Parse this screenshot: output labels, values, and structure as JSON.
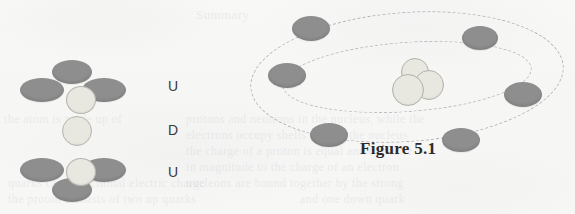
{
  "figure": {
    "caption": "Figure 5.1",
    "background_color": "#f7f7f6",
    "particle_dark_color": "#8e8e8e",
    "particle_light_color": "#e8e8e0",
    "orbit_color": "#b4b4b4"
  },
  "quark_diagram": {
    "name": "proton-quark-composition",
    "groups": [
      {
        "label": "U",
        "label_x": 152,
        "label_y": 18,
        "center": {
          "x": 50,
          "y": 26,
          "w": 28,
          "h": 26,
          "shade": "light"
        },
        "lobes": [
          {
            "x": 36,
            "y": 0,
            "w": 40,
            "h": 24,
            "shade": "dark"
          },
          {
            "x": 4,
            "y": 18,
            "w": 44,
            "h": 24,
            "shade": "dark"
          },
          {
            "x": 66,
            "y": 18,
            "w": 44,
            "h": 24,
            "shade": "dark"
          }
        ]
      },
      {
        "label": "D",
        "label_x": 152,
        "label_y": 62,
        "center": {
          "x": 46,
          "y": 56,
          "w": 28,
          "h": 28,
          "shade": "light"
        },
        "lobes": []
      },
      {
        "label": "U",
        "label_x": 152,
        "label_y": 104,
        "center": {
          "x": 50,
          "y": 98,
          "w": 28,
          "h": 26,
          "shade": "light"
        },
        "lobes": [
          {
            "x": 4,
            "y": 98,
            "w": 44,
            "h": 24,
            "shade": "dark"
          },
          {
            "x": 66,
            "y": 98,
            "w": 44,
            "h": 24,
            "shade": "dark"
          },
          {
            "x": 36,
            "y": 118,
            "w": 40,
            "h": 24,
            "shade": "dark"
          }
        ]
      }
    ],
    "labels": [
      "U",
      "D",
      "U"
    ]
  },
  "atom_diagram": {
    "name": "atom-with-electron-orbits",
    "orbit_count": 2,
    "electron_count": 6,
    "nucleon_count": 3,
    "electrons": [
      {
        "id": "electron-top-left",
        "x": 46,
        "y": 10,
        "w": 38,
        "h": 25
      },
      {
        "id": "electron-top-right",
        "x": 216,
        "y": 20,
        "w": 36,
        "h": 24
      },
      {
        "id": "electron-mid-left",
        "x": 22,
        "y": 57,
        "w": 38,
        "h": 25
      },
      {
        "id": "electron-mid-right",
        "x": 258,
        "y": 76,
        "w": 38,
        "h": 25
      },
      {
        "id": "electron-bottom-left",
        "x": 64,
        "y": 117,
        "w": 38,
        "h": 24
      },
      {
        "id": "electron-bottom-right",
        "x": 196,
        "y": 122,
        "w": 38,
        "h": 24
      }
    ],
    "nucleons": [
      {
        "id": "nucleon-upper",
        "x": 155,
        "y": 52,
        "w": 26,
        "h": 26
      },
      {
        "id": "nucleon-right",
        "x": 168,
        "y": 64,
        "w": 28,
        "h": 28
      },
      {
        "id": "nucleon-left",
        "x": 146,
        "y": 68,
        "w": 30,
        "h": 30
      }
    ]
  },
  "background_ghost_text": [
    {
      "text": "Summary",
      "x": 196,
      "y": 7,
      "size": 13
    },
    {
      "text": "the atom is made up of",
      "x": 4,
      "y": 112,
      "size": 12
    },
    {
      "text": "protons and neutrons in the nucleus, while the",
      "x": 186,
      "y": 112,
      "size": 12
    },
    {
      "text": "electrons occupy shells around the nucleus",
      "x": 186,
      "y": 128,
      "size": 12
    },
    {
      "text": "the charge of a proton is equal and opposite",
      "x": 186,
      "y": 144,
      "size": 12
    },
    {
      "text": "in magnitude to the charge of an electron",
      "x": 186,
      "y": 160,
      "size": 12
    },
    {
      "text": "nucleons are bound together by the strong",
      "x": 186,
      "y": 176,
      "size": 12
    },
    {
      "text": "quarks carry fractional electric charge",
      "x": 8,
      "y": 176,
      "size": 12
    },
    {
      "text": "the proton consists of two up quarks",
      "x": 8,
      "y": 192,
      "size": 12
    },
    {
      "text": "and one down quark",
      "x": 300,
      "y": 192,
      "size": 12
    }
  ]
}
